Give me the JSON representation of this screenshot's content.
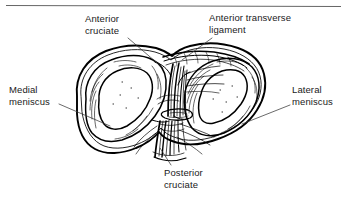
{
  "figure": {
    "kind": "anatomical-line-drawing",
    "ink_color": "#000000",
    "text_color": "#1a1a1a",
    "background_color": "#ffffff",
    "top_rule": {
      "name": "top-horizontal-rule",
      "color": "#555555"
    },
    "labels": [
      {
        "id": "anterior-cruciate",
        "text": "Anterior\ncruciate",
        "line1": "Anterior",
        "line2": "cruciate"
      },
      {
        "id": "anterior-transverse-ligament",
        "text": "Anterior transverse\nligament",
        "line1": "Anterior transverse",
        "line2": "ligament"
      },
      {
        "id": "medial-meniscus",
        "text": "Medial\nmeniscus",
        "line1": "Medial",
        "line2": "meniscus"
      },
      {
        "id": "lateral-meniscus",
        "text": "Lateral\nmeniscus",
        "line1": "Lateral",
        "line2": "meniscus"
      },
      {
        "id": "posterior-cruciate",
        "text": "Posterior\ncruciate",
        "line1": "Posterior",
        "line2": "cruciate"
      }
    ]
  }
}
